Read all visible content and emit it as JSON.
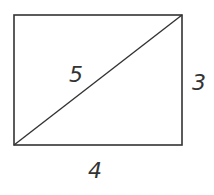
{
  "diagram": {
    "shape": "rectangle-with-diagonal",
    "stroke_color": "#333333",
    "rect": {
      "x": 14,
      "y": 15,
      "width": 168,
      "height": 130
    },
    "labels": {
      "diagonal": "5",
      "right_side": "3",
      "bottom_side": "4"
    }
  }
}
